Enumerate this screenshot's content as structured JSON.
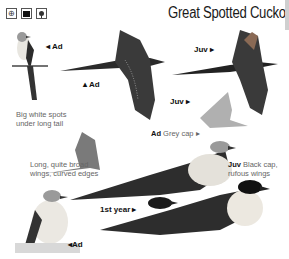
{
  "page": {
    "title": "Great Spotted Cuckoo",
    "icons": [
      {
        "name": "range-icon",
        "glyph": "⊕"
      },
      {
        "name": "habitat-icon",
        "glyph": ""
      },
      {
        "name": "tree-icon",
        "glyph": ""
      }
    ]
  },
  "labels": {
    "ad_perched_top": "◂ Ad",
    "ad_flight": "▴ Ad",
    "juv_flight_top": "Juv ▸",
    "juv_flight_small": "Juv ▸",
    "first_year": "1st year ▸",
    "ad_ground": "◂Ad"
  },
  "captions": {
    "tail_spots": "Big white spots under long tail",
    "wings": "Long, quite broad wings, curved edges",
    "ad_grey_cap_bold": "Ad",
    "ad_grey_cap_text": " Grey cap ▸",
    "juv_black_cap_bold": "Juv",
    "juv_black_cap_text": " Black cap, rufous wings"
  },
  "colors": {
    "plumage_dark": "#2b2b2b",
    "plumage_mid": "#6e6e6e",
    "breast": "#ece8e0",
    "grey_cap": "#9a9a9a"
  }
}
